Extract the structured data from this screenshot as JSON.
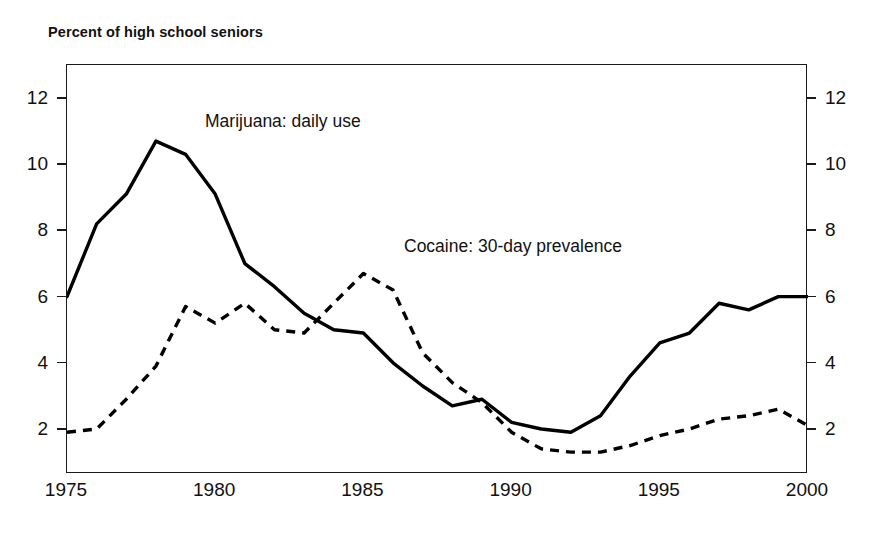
{
  "chart_data": {
    "type": "line",
    "title": "Percent of high school seniors",
    "xlabel": "",
    "ylabel": "",
    "xlim": [
      1975,
      2000
    ],
    "ylim": [
      0.64,
      13.0
    ],
    "grid": false,
    "legend_position": "inline-annotations",
    "x_ticks": [
      "1975",
      "1980",
      "1985",
      "1990",
      "1995",
      "2000"
    ],
    "x_tick_values": [
      1975,
      1980,
      1985,
      1990,
      1995,
      2000
    ],
    "y_ticks": [
      "2",
      "4",
      "6",
      "8",
      "10",
      "12"
    ],
    "y_tick_values": [
      2,
      4,
      6,
      8,
      10,
      12
    ],
    "y_axis_right_ticks": [
      "2",
      "4",
      "6",
      "8",
      "10",
      "12"
    ],
    "x": [
      1975,
      1976,
      1977,
      1978,
      1979,
      1980,
      1981,
      1982,
      1983,
      1984,
      1985,
      1986,
      1987,
      1988,
      1989,
      1990,
      1991,
      1992,
      1993,
      1994,
      1995,
      1996,
      1997,
      1998,
      1999,
      2000
    ],
    "series": [
      {
        "name": "Marijuana: daily use",
        "style": "solid",
        "color": "#000000",
        "annotation": "Marijuana: daily use",
        "values": [
          6.0,
          8.2,
          9.1,
          10.7,
          10.3,
          9.1,
          7.0,
          6.3,
          5.5,
          5.0,
          4.9,
          4.0,
          3.3,
          2.7,
          2.9,
          2.2,
          2.0,
          1.9,
          2.4,
          3.6,
          4.6,
          4.9,
          5.8,
          5.6,
          6.0,
          6.0
        ]
      },
      {
        "name": "Cocaine: 30-day prevalence",
        "style": "dashed",
        "color": "#000000",
        "annotation": "Cocaine: 30-day prevalence",
        "values": [
          1.9,
          2.0,
          2.9,
          3.9,
          5.7,
          5.2,
          5.8,
          5.0,
          4.9,
          5.8,
          6.7,
          6.2,
          4.3,
          3.4,
          2.8,
          1.9,
          1.4,
          1.3,
          1.3,
          1.5,
          1.8,
          2.0,
          2.3,
          2.4,
          2.6,
          2.1
        ]
      }
    ]
  }
}
